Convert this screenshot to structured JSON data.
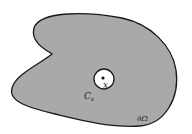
{
  "diagram": {
    "region": {
      "name": "Omega",
      "fill": "#a9a9a9",
      "stroke": "#1a1a1a"
    },
    "labels": {
      "point": "x",
      "circle": "C",
      "circle_sub": "ε",
      "boundary": "∂Ω"
    },
    "circle": {
      "fill": "#ffffff",
      "stroke": "#1a1a1a"
    }
  }
}
